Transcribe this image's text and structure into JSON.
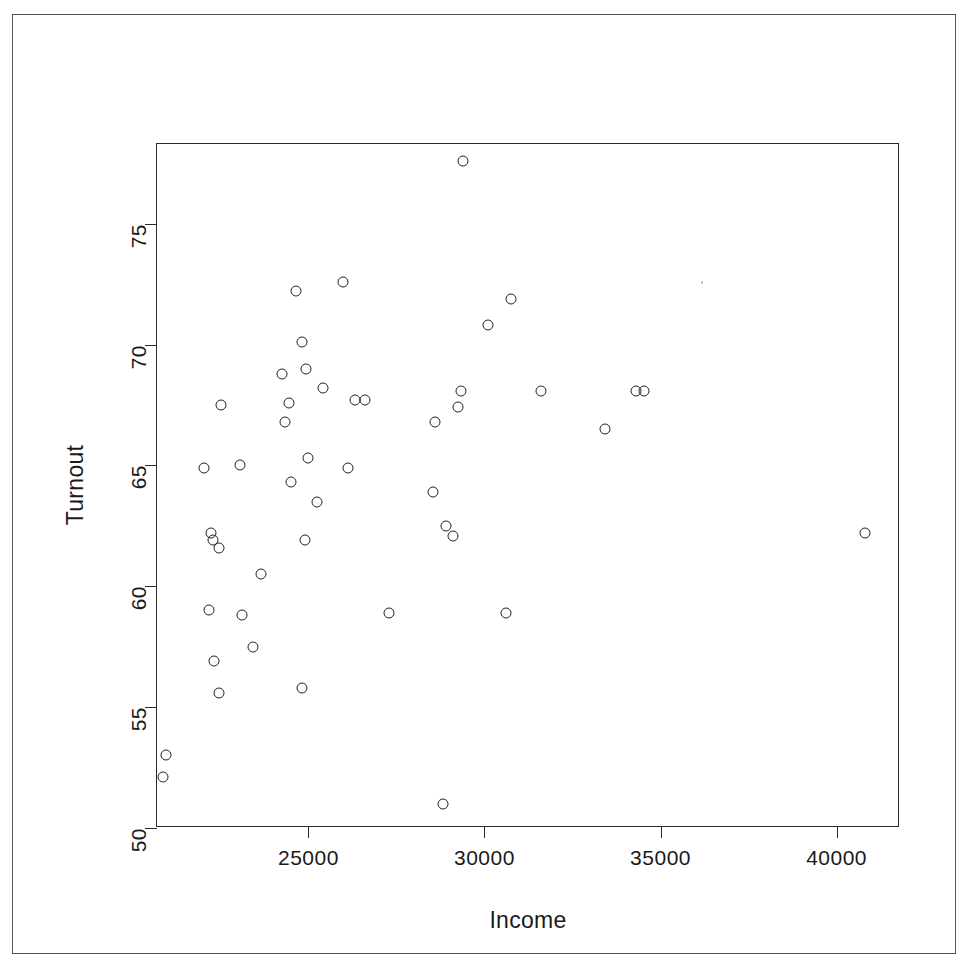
{
  "figure": {
    "background_color": "#ffffff",
    "frame_color": "#555555",
    "axis_color": "#2a2a2a",
    "point_color": "#222222"
  },
  "axis_titles": {
    "x": "Income",
    "y": "Turnout"
  },
  "chart_data": {
    "type": "scatter",
    "title": "",
    "xlabel": "Income",
    "ylabel": "Turnout",
    "xlim": [
      20700,
      41800
    ],
    "ylim": [
      50.0,
      78.3
    ],
    "xticks": [
      25000,
      30000,
      35000,
      40000
    ],
    "yticks": [
      50,
      55,
      60,
      65,
      70,
      75
    ],
    "xtick_labels": [
      "25000",
      "30000",
      "35000",
      "40000"
    ],
    "ytick_labels": [
      "50",
      "55",
      "60",
      "65",
      "70",
      "75"
    ],
    "grid": false,
    "legend": null,
    "marker": "open-circle",
    "n_points": 48,
    "points": [
      {
        "x": 20950,
        "y": 53.0
      },
      {
        "x": 20860,
        "y": 52.1
      },
      {
        "x": 22030,
        "y": 64.9
      },
      {
        "x": 22230,
        "y": 62.2
      },
      {
        "x": 22300,
        "y": 61.9
      },
      {
        "x": 22460,
        "y": 61.6
      },
      {
        "x": 22180,
        "y": 59.0
      },
      {
        "x": 22520,
        "y": 67.5
      },
      {
        "x": 22330,
        "y": 56.9
      },
      {
        "x": 22470,
        "y": 55.6
      },
      {
        "x": 23120,
        "y": 58.8
      },
      {
        "x": 23070,
        "y": 65.0
      },
      {
        "x": 23420,
        "y": 57.5
      },
      {
        "x": 23660,
        "y": 60.5
      },
      {
        "x": 24250,
        "y": 68.8
      },
      {
        "x": 24330,
        "y": 66.8
      },
      {
        "x": 24450,
        "y": 67.6
      },
      {
        "x": 24500,
        "y": 64.3
      },
      {
        "x": 24640,
        "y": 72.2
      },
      {
        "x": 24820,
        "y": 70.1
      },
      {
        "x": 24940,
        "y": 69.0
      },
      {
        "x": 24980,
        "y": 65.3
      },
      {
        "x": 24890,
        "y": 61.9
      },
      {
        "x": 24820,
        "y": 55.8
      },
      {
        "x": 25250,
        "y": 63.5
      },
      {
        "x": 25420,
        "y": 68.2
      },
      {
        "x": 25970,
        "y": 72.6
      },
      {
        "x": 26130,
        "y": 64.9
      },
      {
        "x": 26320,
        "y": 67.7
      },
      {
        "x": 26620,
        "y": 67.7
      },
      {
        "x": 27280,
        "y": 58.9
      },
      {
        "x": 28530,
        "y": 63.9
      },
      {
        "x": 28600,
        "y": 66.8
      },
      {
        "x": 28900,
        "y": 62.5
      },
      {
        "x": 29100,
        "y": 62.1
      },
      {
        "x": 29250,
        "y": 67.4
      },
      {
        "x": 29330,
        "y": 68.1
      },
      {
        "x": 29400,
        "y": 77.6
      },
      {
        "x": 28820,
        "y": 51.0
      },
      {
        "x": 30090,
        "y": 70.8
      },
      {
        "x": 30600,
        "y": 58.9
      },
      {
        "x": 30760,
        "y": 71.9
      },
      {
        "x": 31600,
        "y": 68.1
      },
      {
        "x": 33430,
        "y": 66.5
      },
      {
        "x": 34300,
        "y": 68.1
      },
      {
        "x": 34520,
        "y": 68.1
      },
      {
        "x": 40820,
        "y": 62.2
      }
    ]
  }
}
